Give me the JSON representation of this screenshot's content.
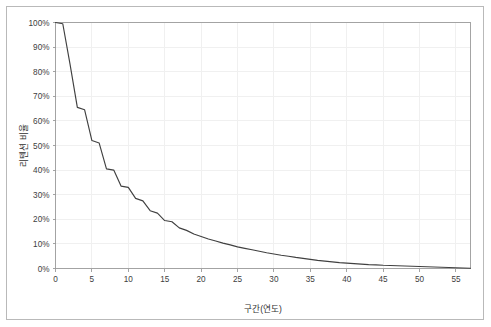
{
  "chart_data": {
    "type": "line",
    "title": "",
    "subtitle": "",
    "xlabel": "구간(연도)",
    "ylabel": "리텐션 비율",
    "xlim": [
      0,
      57
    ],
    "ylim": [
      0,
      1.0
    ],
    "grid": true,
    "legend": false,
    "legend_position": "none",
    "xticks": [
      0,
      5,
      10,
      15,
      20,
      25,
      30,
      35,
      40,
      45,
      50,
      55
    ],
    "xtick_labels": [
      "0",
      "5",
      "10",
      "15",
      "20",
      "25",
      "30",
      "35",
      "40",
      "45",
      "50",
      "55"
    ],
    "yticks": [
      0,
      0.1,
      0.2,
      0.3,
      0.4,
      0.5,
      0.6,
      0.7,
      0.8,
      0.9,
      1.0
    ],
    "ytick_labels": [
      "0%",
      "10%",
      "20%",
      "30%",
      "40%",
      "50%",
      "60%",
      "70%",
      "80%",
      "90%",
      "100%"
    ],
    "series": [
      {
        "name": "리텐션 비율",
        "color": "#404040",
        "x": [
          0,
          1,
          2,
          3,
          4,
          5,
          6,
          7,
          8,
          9,
          10,
          11,
          12,
          13,
          14,
          15,
          16,
          17,
          18,
          19,
          20,
          21,
          22,
          23,
          24,
          25,
          26,
          27,
          28,
          29,
          30,
          31,
          32,
          33,
          34,
          35,
          36,
          37,
          38,
          39,
          40,
          41,
          42,
          43,
          44,
          45,
          46,
          47,
          48,
          49,
          50,
          51,
          52,
          53,
          54,
          55,
          56,
          57
        ],
        "values": [
          1.0,
          0.995,
          0.83,
          0.655,
          0.645,
          0.52,
          0.51,
          0.405,
          0.4,
          0.335,
          0.33,
          0.285,
          0.275,
          0.235,
          0.225,
          0.195,
          0.19,
          0.165,
          0.155,
          0.14,
          0.13,
          0.12,
          0.112,
          0.103,
          0.096,
          0.088,
          0.082,
          0.076,
          0.07,
          0.064,
          0.059,
          0.054,
          0.05,
          0.045,
          0.041,
          0.037,
          0.033,
          0.03,
          0.027,
          0.024,
          0.022,
          0.02,
          0.018,
          0.016,
          0.015,
          0.013,
          0.012,
          0.011,
          0.01,
          0.009,
          0.008,
          0.007,
          0.006,
          0.005,
          0.004,
          0.003,
          0.002,
          0.001
        ]
      }
    ]
  },
  "colors": {
    "line": "#404040",
    "axis": "#9a9a9a",
    "grid": "#f0f0f0",
    "frame": "#b9b9b9",
    "text": "#404040",
    "background": "#ffffff"
  }
}
